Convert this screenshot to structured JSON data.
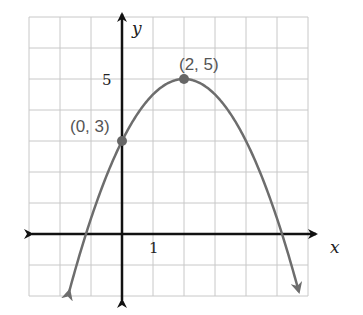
{
  "chart_data": {
    "type": "line",
    "title": "",
    "function": "y = -0.5(x - 2)^2 + 5",
    "xlabel": "x",
    "ylabel": "y",
    "xlim": [
      -3,
      6
    ],
    "ylim": [
      -2,
      7
    ],
    "grid": true,
    "tick_labels": {
      "x": [
        "1"
      ],
      "y": [
        "5"
      ]
    },
    "points": [
      {
        "x": 0,
        "y": 3,
        "label": "(0, 3)"
      },
      {
        "x": 2,
        "y": 5,
        "label": "(2, 5)"
      }
    ],
    "curve_color": "#6d6d6d",
    "axis_color": "#111111",
    "grid_color": "#c8c8c8"
  },
  "labels": {
    "x_axis": "x",
    "y_axis": "y",
    "tick_x1": "1",
    "tick_y5": "5",
    "point_intercept": "(0, 3)",
    "point_vertex": "(2, 5)"
  }
}
